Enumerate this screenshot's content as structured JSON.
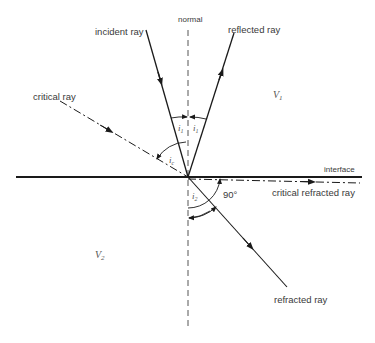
{
  "diagram": {
    "labels": {
      "normal": "normal",
      "incident_ray": "incident ray",
      "reflected_ray": "reflected ray",
      "critical_ray": "critical ray",
      "interface": "interface",
      "critical_refracted_ray": "critical refracted ray",
      "refracted_ray": "refracted ray",
      "angle_90": "90°"
    },
    "media": {
      "upper": {
        "symbol": "V",
        "subscript": "1"
      },
      "lower": {
        "symbol": "V",
        "subscript": "2"
      }
    },
    "angles": {
      "incident": {
        "symbol": "i",
        "subscript": "1"
      },
      "reflected": {
        "symbol": "i",
        "subscript": "1"
      },
      "critical": {
        "symbol": "i",
        "subscript": "c"
      },
      "refracted": {
        "symbol": "i",
        "subscript": "2"
      }
    },
    "colors": {
      "line": "#1a1a1a",
      "normal": "#555555",
      "text": "#3a3a3a"
    }
  }
}
